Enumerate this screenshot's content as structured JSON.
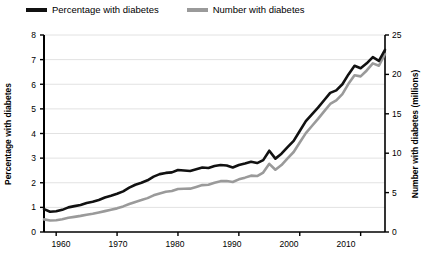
{
  "legend": {
    "items": [
      {
        "label": "Percentage with diabetes",
        "color": "#111111",
        "series": "percentage"
      },
      {
        "label": "Number with diabetes",
        "color": "#9a9a9a",
        "series": "number"
      }
    ]
  },
  "axes": {
    "left_title": "Percentage with diabetes",
    "right_title": "Number with diabetes (millions)",
    "left_ticks": [
      "0",
      "1",
      "2",
      "3",
      "4",
      "5",
      "6",
      "7",
      "8"
    ],
    "right_ticks": [
      "0",
      "5",
      "10",
      "15",
      "20",
      "25"
    ],
    "x_ticks": [
      "1960",
      "1970",
      "1980",
      "1990",
      "2000",
      "2010"
    ]
  },
  "colors": {
    "percentage_line": "#111111",
    "number_line": "#9a9a9a",
    "gridline": "#e2e2e2",
    "axis": "#000000",
    "background": "#ffffff"
  },
  "chart_data": {
    "type": "line",
    "title": "",
    "xlabel": "",
    "ylabel": "Percentage with diabetes",
    "y2label": "Number with diabetes (millions)",
    "xlim": [
      1958,
      2014
    ],
    "ylim": [
      0,
      8
    ],
    "y2lim": [
      0,
      25
    ],
    "grid": true,
    "legend_position": "top-left",
    "x": [
      1958,
      1959,
      1960,
      1961,
      1962,
      1963,
      1964,
      1965,
      1966,
      1967,
      1968,
      1969,
      1970,
      1971,
      1972,
      1973,
      1974,
      1975,
      1976,
      1977,
      1978,
      1979,
      1980,
      1981,
      1982,
      1983,
      1984,
      1985,
      1986,
      1987,
      1988,
      1989,
      1990,
      1991,
      1992,
      1993,
      1994,
      1995,
      1996,
      1997,
      1998,
      1999,
      2000,
      2001,
      2002,
      2003,
      2004,
      2005,
      2006,
      2007,
      2008,
      2009,
      2010,
      2011,
      2012,
      2013,
      2014
    ],
    "series": [
      {
        "name": "Percentage with diabetes",
        "unit": "%",
        "axis": "left",
        "color": "#111111",
        "values": [
          0.93,
          0.82,
          0.84,
          0.9,
          1.0,
          1.05,
          1.1,
          1.18,
          1.23,
          1.3,
          1.4,
          1.47,
          1.55,
          1.65,
          1.8,
          1.92,
          2.0,
          2.1,
          2.25,
          2.35,
          2.4,
          2.42,
          2.52,
          2.5,
          2.48,
          2.55,
          2.62,
          2.6,
          2.68,
          2.72,
          2.7,
          2.62,
          2.72,
          2.78,
          2.85,
          2.8,
          2.92,
          3.3,
          2.98,
          3.18,
          3.45,
          3.7,
          4.1,
          4.5,
          4.78,
          5.05,
          5.35,
          5.65,
          5.75,
          6.0,
          6.4,
          6.75,
          6.65,
          6.85,
          7.1,
          6.95,
          7.4
        ]
      },
      {
        "name": "Number with diabetes",
        "unit": "millions",
        "axis": "right",
        "color": "#9a9a9a",
        "values": [
          1.6,
          1.45,
          1.5,
          1.62,
          1.8,
          1.92,
          2.05,
          2.2,
          2.32,
          2.48,
          2.65,
          2.82,
          3.0,
          3.25,
          3.55,
          3.82,
          4.05,
          4.3,
          4.65,
          4.9,
          5.1,
          5.2,
          5.45,
          5.48,
          5.5,
          5.72,
          5.95,
          6.0,
          6.25,
          6.45,
          6.48,
          6.35,
          6.68,
          6.9,
          7.15,
          7.1,
          7.55,
          8.65,
          7.9,
          8.5,
          9.35,
          10.15,
          11.35,
          12.55,
          13.45,
          14.35,
          15.3,
          16.25,
          16.7,
          17.5,
          18.8,
          19.9,
          19.75,
          20.5,
          21.4,
          21.1,
          22.6
        ]
      }
    ]
  }
}
